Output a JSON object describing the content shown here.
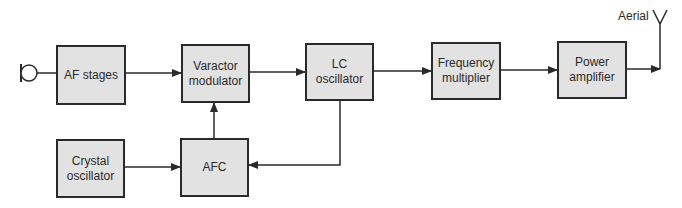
{
  "diagram": {
    "type": "block-diagram",
    "colors": {
      "block_fill": "#e2e2e2",
      "line": "#2a2a2a",
      "background": "#ffffff"
    },
    "input": {
      "symbol": "microphone"
    },
    "output": {
      "symbol": "antenna",
      "label": "Aerial"
    },
    "blocks": [
      {
        "id": "af",
        "label": "AF stages"
      },
      {
        "id": "varactor",
        "label": "Varactor\nmodulator"
      },
      {
        "id": "lc",
        "label": "LC\noscillator"
      },
      {
        "id": "freqmul",
        "label": "Frequency\nmultiplier"
      },
      {
        "id": "pa",
        "label": "Power\namplifier"
      },
      {
        "id": "crystal",
        "label": "Crystal\noscillator"
      },
      {
        "id": "afc",
        "label": "AFC"
      }
    ],
    "connections": [
      {
        "from": "microphone",
        "to": "af"
      },
      {
        "from": "af",
        "to": "varactor"
      },
      {
        "from": "varactor",
        "to": "lc"
      },
      {
        "from": "lc",
        "to": "freqmul"
      },
      {
        "from": "freqmul",
        "to": "pa"
      },
      {
        "from": "pa",
        "to": "antenna"
      },
      {
        "from": "crystal",
        "to": "afc"
      },
      {
        "from": "lc",
        "to": "afc"
      },
      {
        "from": "afc",
        "to": "varactor"
      }
    ]
  }
}
